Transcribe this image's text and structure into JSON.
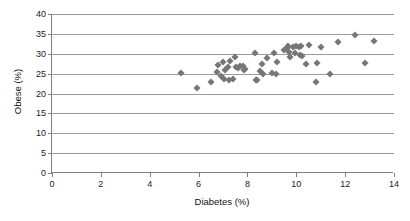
{
  "chart_data": {
    "type": "scatter",
    "title": "",
    "xlabel": "Diabetes (%)",
    "ylabel": "Obese (%)",
    "xlim": [
      0,
      14
    ],
    "ylim": [
      0,
      40
    ],
    "xticks": [
      0,
      2,
      4,
      6,
      8,
      10,
      12,
      14
    ],
    "yticks": [
      0,
      5,
      10,
      15,
      20,
      25,
      30,
      35,
      40
    ],
    "xtick_labels": [
      "0",
      "2",
      "4",
      "6",
      "8",
      "10",
      "12",
      "14"
    ],
    "ytick_labels": [
      "0",
      "5",
      "10",
      "15",
      "20",
      "25",
      "30",
      "35",
      "40"
    ],
    "grid": "horizontal",
    "legend": "none",
    "marker": {
      "shape": "diamond",
      "color": "#767676",
      "size": 5
    },
    "series": [
      {
        "name": "states",
        "points": [
          [
            5.3,
            25.2
          ],
          [
            5.95,
            21.4
          ],
          [
            6.5,
            23.0
          ],
          [
            6.75,
            25.3
          ],
          [
            6.8,
            27.2
          ],
          [
            6.9,
            24.3
          ],
          [
            7.0,
            27.8
          ],
          [
            7.05,
            23.6
          ],
          [
            7.1,
            26.0
          ],
          [
            7.2,
            26.6
          ],
          [
            7.25,
            23.5
          ],
          [
            7.3,
            28.3
          ],
          [
            7.4,
            23.6
          ],
          [
            7.5,
            29.3
          ],
          [
            7.55,
            26.7
          ],
          [
            7.6,
            26.4
          ],
          [
            7.7,
            26.8
          ],
          [
            7.8,
            26.9
          ],
          [
            7.85,
            25.9
          ],
          [
            7.9,
            26.2
          ],
          [
            8.3,
            30.1
          ],
          [
            8.35,
            23.4
          ],
          [
            8.4,
            23.3
          ],
          [
            8.5,
            25.6
          ],
          [
            8.6,
            27.3
          ],
          [
            8.65,
            24.8
          ],
          [
            8.8,
            28.9
          ],
          [
            9.0,
            25.1
          ],
          [
            9.1,
            30.1
          ],
          [
            9.15,
            24.9
          ],
          [
            9.2,
            28.0
          ],
          [
            9.5,
            31.0
          ],
          [
            9.6,
            31.5
          ],
          [
            9.65,
            31.9
          ],
          [
            9.7,
            30.5
          ],
          [
            9.75,
            29.3
          ],
          [
            9.85,
            31.6
          ],
          [
            9.95,
            30.3
          ],
          [
            10.0,
            31.9
          ],
          [
            10.1,
            31.8
          ],
          [
            10.15,
            29.8
          ],
          [
            10.2,
            31.9
          ],
          [
            10.25,
            29.4
          ],
          [
            10.4,
            27.3
          ],
          [
            10.5,
            32.1
          ],
          [
            10.8,
            22.8
          ],
          [
            10.85,
            27.7
          ],
          [
            11.0,
            31.8
          ],
          [
            11.4,
            24.9
          ],
          [
            11.7,
            33.0
          ],
          [
            12.4,
            34.7
          ],
          [
            12.8,
            27.7
          ],
          [
            13.2,
            33.2
          ]
        ]
      }
    ]
  }
}
